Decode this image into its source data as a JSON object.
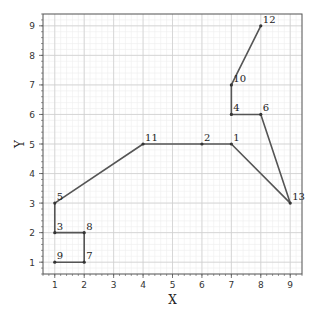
{
  "chart_data": {
    "type": "line",
    "title": "",
    "xlabel": "X",
    "ylabel": "Y",
    "xlim": [
      0.6,
      9.4
    ],
    "ylim": [
      0.6,
      9.4
    ],
    "xticks": [
      1,
      2,
      3,
      4,
      5,
      6,
      7,
      8,
      9
    ],
    "yticks": [
      1,
      2,
      3,
      4,
      5,
      6,
      7,
      8,
      9
    ],
    "grid": {
      "major": true,
      "minor": true
    },
    "minor_step": 0.2,
    "series": [
      {
        "name": "path",
        "points": [
          {
            "label": "9",
            "x": 1,
            "y": 1
          },
          {
            "label": "7",
            "x": 2,
            "y": 1
          },
          {
            "label": "8",
            "x": 2,
            "y": 2
          },
          {
            "label": "3",
            "x": 1,
            "y": 2
          },
          {
            "label": "5",
            "x": 1,
            "y": 3
          },
          {
            "label": "11",
            "x": 4,
            "y": 5
          },
          {
            "label": "2",
            "x": 6,
            "y": 5
          },
          {
            "label": "1",
            "x": 7,
            "y": 5
          },
          {
            "label": "13",
            "x": 9,
            "y": 3
          },
          {
            "label": "6",
            "x": 8,
            "y": 6
          },
          {
            "label": "4",
            "x": 7,
            "y": 6
          },
          {
            "label": "10",
            "x": 7,
            "y": 7
          },
          {
            "label": "12",
            "x": 8,
            "y": 9
          }
        ]
      }
    ]
  },
  "colors": {
    "line": "#555555",
    "marker": "#333333",
    "spine": "#555555",
    "major_grid": "#cfcfcf",
    "minor_grid": "#eeeeee"
  }
}
